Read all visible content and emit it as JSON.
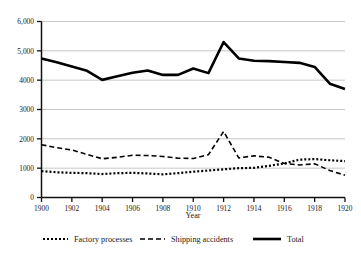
{
  "chart_data": {
    "type": "line",
    "title": "",
    "xlabel": "Year",
    "ylabel": "",
    "xlim": [
      1900,
      1920
    ],
    "ylim": [
      0,
      6000
    ],
    "grid": true,
    "legend_position": "bottom",
    "x": [
      1900,
      1901,
      1902,
      1903,
      1904,
      1905,
      1906,
      1907,
      1908,
      1909,
      1910,
      1911,
      1912,
      1913,
      1914,
      1915,
      1916,
      1917,
      1918,
      1919,
      1920
    ],
    "xticks": [
      1900,
      1902,
      1904,
      1906,
      1908,
      1910,
      1912,
      1914,
      1916,
      1918,
      1920
    ],
    "xtick_labels": [
      "1900",
      "1902",
      "1904",
      "1906",
      "1908",
      "1910",
      "1912",
      "1914",
      "1916",
      "1918",
      "1920"
    ],
    "yticks": [
      0,
      1000,
      2000,
      3000,
      4000,
      5000,
      6000
    ],
    "ytick_labels": [
      "0",
      "1000",
      "2000",
      "3000",
      "4000",
      "5,000",
      "6,000"
    ],
    "series": [
      {
        "name": "Factory processes",
        "style": "dotted",
        "values": [
          900,
          860,
          840,
          830,
          800,
          830,
          840,
          820,
          790,
          830,
          880,
          920,
          960,
          1000,
          1010,
          1080,
          1160,
          1290,
          1310,
          1270,
          1240
        ]
      },
      {
        "name": "Shipping accidents",
        "style": "dashed",
        "values": [
          1800,
          1700,
          1620,
          1470,
          1320,
          1370,
          1440,
          1430,
          1400,
          1340,
          1330,
          1460,
          2250,
          1350,
          1420,
          1370,
          1160,
          1110,
          1150,
          920,
          760
        ]
      },
      {
        "name": "Total",
        "style": "solid",
        "values": [
          4740,
          4610,
          4470,
          4320,
          4010,
          4130,
          4250,
          4330,
          4180,
          4180,
          4400,
          4240,
          5300,
          4740,
          4660,
          4650,
          4620,
          4590,
          4450,
          3880,
          3700
        ]
      }
    ]
  },
  "legend": {
    "items": [
      {
        "label": "Factory processes",
        "style": "dotted"
      },
      {
        "label": "Shipping accidents",
        "style": "dashed"
      },
      {
        "label": "Total",
        "style": "solid"
      }
    ]
  },
  "axis": {
    "x_title": "Year"
  }
}
